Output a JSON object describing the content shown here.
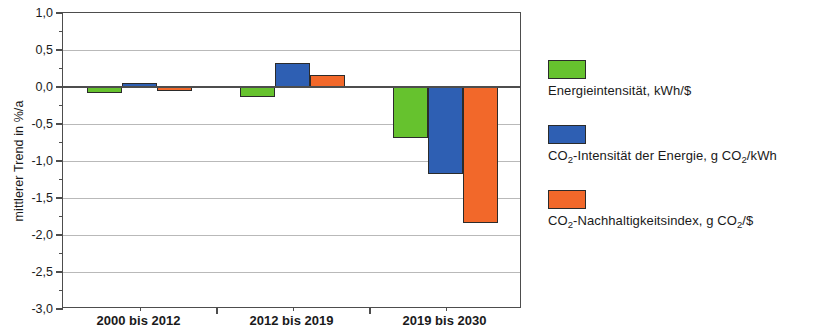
{
  "chart_data": {
    "type": "bar",
    "title": "",
    "subtitle": "",
    "xlabel": "",
    "ylabel": "mittlerer Trend in %/a",
    "ylim": [
      -3.0,
      1.0
    ],
    "ytick_step": 0.5,
    "grid": true,
    "legend_position": "right",
    "categories": [
      "2000 bis 2012",
      "2012 bis 2019",
      "2019 bis 2030"
    ],
    "ytick_labels": [
      "1,0",
      "0,5",
      "0,0",
      "-0,5",
      "-1,0",
      "-1,5",
      "-2,0",
      "-2,5",
      "-3,0"
    ],
    "ytick_values": [
      1.0,
      0.5,
      0.0,
      -0.5,
      -1.0,
      -1.5,
      -2.0,
      -2.5,
      -3.0
    ],
    "series": [
      {
        "name": "Energieintensität, kWh/$",
        "color": "#66c22e",
        "values": [
          -0.08,
          -0.14,
          -0.69
        ]
      },
      {
        "name": "CO2-Intensität der Energie, g CO2/kWh",
        "color": "#2e5fb3",
        "values": [
          0.05,
          0.32,
          -1.18
        ]
      },
      {
        "name": "CO2-Nachhaltigkeitsindex, g CO2/$",
        "color": "#f2682a",
        "values": [
          -0.06,
          0.16,
          -1.84
        ]
      }
    ]
  },
  "axes": {
    "y_title": "mittlerer Trend in %/a",
    "ticks": [
      {
        "label": "1,0",
        "value": 1.0
      },
      {
        "label": "0,5",
        "value": 0.5
      },
      {
        "label": "0,0",
        "value": 0.0
      },
      {
        "label": "-0,5",
        "value": -0.5
      },
      {
        "label": "-1,0",
        "value": -1.0
      },
      {
        "label": "-1,5",
        "value": -1.5
      },
      {
        "label": "-2,0",
        "value": -2.0
      },
      {
        "label": "-2,5",
        "value": -2.5
      },
      {
        "label": "-3,0",
        "value": -3.0
      }
    ],
    "categories": [
      {
        "label": "2000 bis 2012"
      },
      {
        "label": "2012 bis 2019"
      },
      {
        "label": "2019 bis 2030"
      }
    ]
  },
  "legend": {
    "entries": [
      {
        "label_prefix": "",
        "label_full": "Energieintensität, kWh/$",
        "parts": [
          {
            "t": "Energieintensität, kWh/$",
            "sub": false
          }
        ],
        "color": "#66c22e"
      },
      {
        "label_prefix": "",
        "label_full": "CO2-Intensität der Energie, g CO2/kWh",
        "parts": [
          {
            "t": "CO",
            "sub": false
          },
          {
            "t": "2",
            "sub": true
          },
          {
            "t": "-Intensität der Energie, g CO",
            "sub": false
          },
          {
            "t": "2",
            "sub": true
          },
          {
            "t": "/kWh",
            "sub": false
          }
        ],
        "color": "#2e5fb3"
      },
      {
        "label_prefix": "",
        "label_full": "CO2-Nachhaltigkeitsindex, g CO2/$",
        "parts": [
          {
            "t": "CO",
            "sub": false
          },
          {
            "t": "2",
            "sub": true
          },
          {
            "t": "-Nachhaltigkeitsindex, g CO",
            "sub": false
          },
          {
            "t": "2",
            "sub": true
          },
          {
            "t": "/$",
            "sub": false
          }
        ],
        "color": "#f2682a"
      }
    ]
  },
  "colors": {
    "series_green": "#66c22e",
    "series_blue": "#2e5fb3",
    "series_orange": "#f2682a",
    "axis": "#4d4d4d",
    "grid": "#b9b9b9",
    "background": "#ffffff"
  }
}
